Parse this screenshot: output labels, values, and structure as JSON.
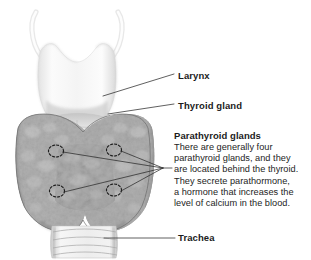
{
  "figure": {
    "background_color": "#ffffff",
    "style": "grayscale medical illustration, anterior view"
  },
  "annotations": {
    "larynx": {
      "label": "Larynx",
      "leader_from": [
        118,
        95
      ],
      "leader_to": [
        174,
        74
      ]
    },
    "thyroid": {
      "label": "Thyroid gland",
      "leader_from": [
        120,
        113
      ],
      "leader_to": [
        174,
        104
      ]
    },
    "parathyroid": {
      "heading": "Parathyroid glands",
      "body_lines": [
        "There are generally four",
        "parathyroid glands, and they",
        "are located behind the thyroid.",
        "They secrete parathormone,",
        "a hormone that increases the",
        "level of calcium in the blood."
      ],
      "gland_markers": [
        {
          "cx": 56,
          "cy": 151,
          "rx": 7.5,
          "ry": 6.0
        },
        {
          "cx": 114,
          "cy": 150,
          "rx": 7.5,
          "ry": 6.0
        },
        {
          "cx": 57,
          "cy": 191,
          "rx": 7.5,
          "ry": 6.0
        },
        {
          "cx": 114,
          "cy": 190,
          "rx": 7.5,
          "ry": 6.0
        }
      ],
      "leader_converge": [
        163,
        168
      ]
    },
    "trachea": {
      "label": "Trachea",
      "leader_from": [
        104,
        238
      ],
      "leader_to": [
        175,
        238
      ]
    }
  },
  "anatomy": {
    "parts": [
      {
        "name": "superior horns of thyroid cartilage",
        "tone": "#fafafa"
      },
      {
        "name": "thyroid cartilage (larynx)",
        "tone": "#f0f0f0"
      },
      {
        "name": "cricothyroid membrane",
        "tone": "#dcdcdc"
      },
      {
        "name": "thyroid gland right lobe",
        "tone": "#9d9d9d"
      },
      {
        "name": "thyroid gland left lobe",
        "tone": "#9d9d9d"
      },
      {
        "name": "thyroid isthmus",
        "tone": "#a6a6a6"
      },
      {
        "name": "tracheal cartilage rings",
        "tone": "#ededed"
      }
    ]
  },
  "colors": {
    "line": "#2b2b2b",
    "text": "#1b1b1b",
    "body_text": "#242424",
    "background": "#ffffff"
  }
}
